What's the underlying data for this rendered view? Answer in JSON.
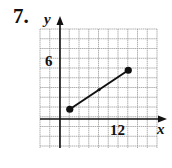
{
  "problem": {
    "number": "7."
  },
  "chart_data": {
    "type": "line",
    "title": "",
    "xlabel": "x",
    "ylabel": "y",
    "grid": true,
    "x_grid_step": 2,
    "y_grid_step": 1,
    "xlim": [
      -4,
      20
    ],
    "ylim": [
      -3,
      9
    ],
    "tick_labels": {
      "x": [
        "12"
      ],
      "y": [
        "6"
      ]
    },
    "x_tick_values": [
      12
    ],
    "y_tick_values": [
      6
    ],
    "segment": {
      "start": {
        "x": 2,
        "y": 1
      },
      "end": {
        "x": 14,
        "y": 5
      },
      "midpoint_marker": {
        "x": 8,
        "y": 3
      }
    },
    "points": [
      {
        "x": 2,
        "y": 1
      },
      {
        "x": 14,
        "y": 5
      }
    ]
  },
  "colors": {
    "grid": "#9a9a9a",
    "axis": "#111111",
    "segment": "#111111"
  }
}
